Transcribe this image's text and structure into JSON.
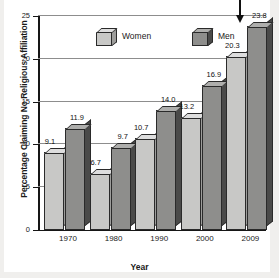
{
  "chart_data": {
    "type": "bar",
    "title": "",
    "xlabel": "Year",
    "ylabel": "Percentage Claiming No Religious Affiliation",
    "categories": [
      "1970",
      "1980",
      "1990",
      "2000",
      "2009"
    ],
    "series": [
      {
        "name": "Women",
        "values": [
          9.1,
          6.7,
          10.7,
          13.2,
          20.3
        ],
        "color": "#c8c8c6"
      },
      {
        "name": "Men",
        "values": [
          11.9,
          9.7,
          14.0,
          16.9,
          23.8
        ],
        "color": "#8e8e8c"
      }
    ],
    "ylim": [
      0,
      25
    ],
    "yticks": [
      0,
      5,
      10,
      15,
      20,
      25
    ],
    "ytick_labels": [
      "0",
      "5",
      "10",
      "15",
      "20",
      "25"
    ],
    "grid": true,
    "legend_position": "top-center",
    "annotations": [
      {
        "name": "arrow-to-2009-men",
        "target": "2009 Men 23.8",
        "glyph": "down-arrow"
      }
    ],
    "value_labels": [
      "9.1",
      "11.9",
      "6.7",
      "9.7",
      "10.7",
      "14.0",
      "13.2",
      "16.9",
      "20.3",
      "23.8"
    ]
  },
  "legend": {
    "items": [
      {
        "label": "Women",
        "swatch": "women-cube-icon"
      },
      {
        "label": "Men",
        "swatch": "men-cube-icon"
      }
    ]
  },
  "axes": {
    "y_title": "Percentage Claiming No Religious Affiliation",
    "x_title": "Year"
  }
}
